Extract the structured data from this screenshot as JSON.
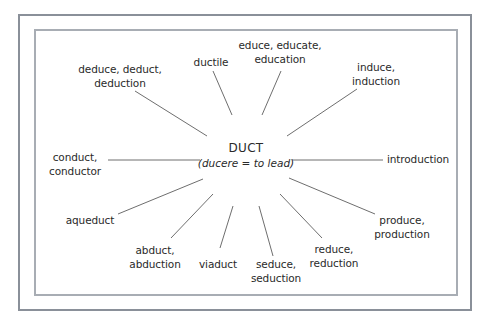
{
  "diagram": {
    "type": "radial word map",
    "center": {
      "title": "DUCT",
      "subtitle": "(ducere = to lead)"
    },
    "branches": [
      {
        "line1": "deduce, deduct,",
        "line2": "deduction"
      },
      {
        "line1": "ductile",
        "line2": ""
      },
      {
        "line1": "educe, educate,",
        "line2": "education"
      },
      {
        "line1": "induce,",
        "line2": "induction"
      },
      {
        "line1": "conduct,",
        "line2": "conductor"
      },
      {
        "line1": "introduction",
        "line2": ""
      },
      {
        "line1": "aqueduct",
        "line2": ""
      },
      {
        "line1": "abduct,",
        "line2": "abduction"
      },
      {
        "line1": "viaduct",
        "line2": ""
      },
      {
        "line1": "seduce,",
        "line2": "seduction"
      },
      {
        "line1": "reduce,",
        "line2": "reduction"
      },
      {
        "line1": "produce,",
        "line2": "production"
      }
    ],
    "colors": {
      "outer_border": "#8a9099",
      "inner_border": "#a8adb4",
      "lines": "#6e6e6e",
      "text": "#2a2a2a"
    }
  }
}
